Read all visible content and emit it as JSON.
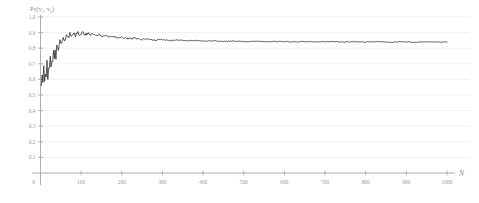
{
  "chart_data": {
    "type": "line",
    "title": "",
    "subtitle": "",
    "xlabel": "N",
    "ylabel": "Pr(v_i, v_j)",
    "ylabel_parts": {
      "prefix": "Pr(v",
      "sub1": "i",
      "mid": ", v",
      "sub2": "j",
      "suffix": ")"
    },
    "xlim": [
      0,
      1000
    ],
    "ylim": [
      0,
      1.0
    ],
    "grid": true,
    "grid_axis": "y",
    "legend": "none",
    "origin_label": "0",
    "ytick_labels": [
      "1.0",
      "0.9",
      "0.8",
      "0.7",
      "0.6",
      "0.5",
      "0.4",
      "0.3",
      "0.2",
      "0.1"
    ],
    "ytick_values": [
      1.0,
      0.9,
      0.8,
      0.7,
      0.6,
      0.5,
      0.4,
      0.3,
      0.2,
      0.1
    ],
    "xtick_labels": [
      "100",
      "200",
      "300",
      "400",
      "500",
      "600",
      "700",
      "800",
      "900",
      "1000"
    ],
    "xtick_values": [
      100,
      200,
      300,
      400,
      500,
      600,
      700,
      800,
      900,
      1000
    ],
    "series": [
      {
        "name": "Pr(v_i, v_j)",
        "color": "#232323",
        "x": [
          2,
          4,
          6,
          8,
          10,
          12,
          14,
          16,
          18,
          20,
          22,
          24,
          26,
          28,
          30,
          32,
          34,
          36,
          38,
          40,
          44,
          48,
          52,
          56,
          60,
          64,
          68,
          72,
          76,
          80,
          86,
          92,
          98,
          104,
          110,
          116,
          122,
          128,
          136,
          144,
          152,
          160,
          170,
          180,
          190,
          200,
          215,
          230,
          245,
          260,
          280,
          300,
          320,
          340,
          360,
          380,
          400,
          425,
          450,
          475,
          500,
          530,
          560,
          590,
          620,
          650,
          680,
          710,
          740,
          770,
          800,
          830,
          860,
          890,
          920,
          950,
          980,
          1000
        ],
        "y": [
          0.575,
          0.655,
          0.6,
          0.7,
          0.585,
          0.66,
          0.62,
          0.71,
          0.615,
          0.68,
          0.645,
          0.735,
          0.66,
          0.72,
          0.69,
          0.765,
          0.705,
          0.78,
          0.745,
          0.81,
          0.79,
          0.845,
          0.825,
          0.862,
          0.848,
          0.878,
          0.866,
          0.89,
          0.874,
          0.897,
          0.882,
          0.899,
          0.886,
          0.901,
          0.889,
          0.896,
          0.884,
          0.893,
          0.879,
          0.888,
          0.876,
          0.882,
          0.871,
          0.877,
          0.866,
          0.87,
          0.861,
          0.864,
          0.856,
          0.859,
          0.852,
          0.855,
          0.849,
          0.852,
          0.847,
          0.85,
          0.845,
          0.848,
          0.843,
          0.846,
          0.842,
          0.845,
          0.841,
          0.844,
          0.84,
          0.843,
          0.84,
          0.843,
          0.839,
          0.842,
          0.839,
          0.842,
          0.838,
          0.841,
          0.838,
          0.841,
          0.839,
          0.84
        ]
      }
    ],
    "notes": {
      "start_value": 0.575,
      "peak_value": 0.901,
      "peak_x": 104,
      "plateau_value": 0.84
    }
  },
  "colors": {
    "line": "#232323",
    "grid": "#eceaea",
    "axis": "#9b9b9b",
    "text": "#9a9a9a",
    "background": "#ffffff"
  }
}
